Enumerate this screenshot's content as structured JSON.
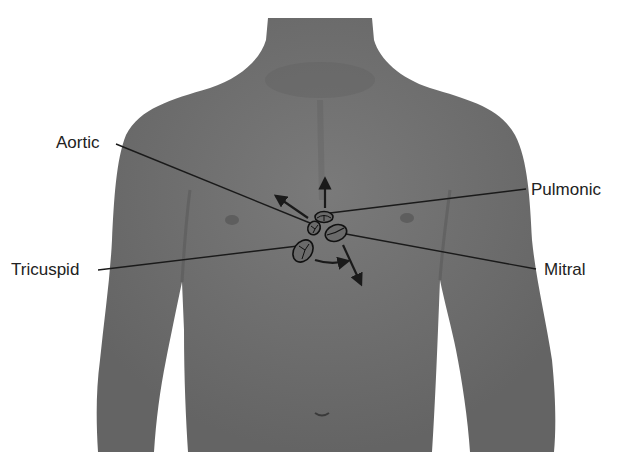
{
  "figure": {
    "colors": {
      "background": "#ffffff",
      "skin": "#6e6e6e",
      "skin_light": "#7d7d7d",
      "skin_dark": "#5a5a5a",
      "line": "#1a1a1a",
      "text": "#222222"
    }
  },
  "labels": {
    "aortic": "Aortic",
    "pulmonic": "Pulmonic",
    "tricuspid": "Tricuspid",
    "mitral": "Mitral"
  },
  "valves": [
    {
      "name": "pulmonic-valve",
      "cx": 324,
      "cy": 217
    },
    {
      "name": "aortic-valve",
      "cx": 314,
      "cy": 227
    },
    {
      "name": "mitral-valve",
      "cx": 336,
      "cy": 233
    },
    {
      "name": "tricuspid-valve",
      "cx": 303,
      "cy": 251
    }
  ],
  "arrows": [
    {
      "name": "aortic-flow-arrow",
      "from": [
        308,
        218
      ],
      "to": [
        275,
        195
      ]
    },
    {
      "name": "pulmonic-flow-arrow",
      "from": [
        325,
        208
      ],
      "to": [
        325,
        178
      ]
    },
    {
      "name": "tricuspid-flow-arrow",
      "from": [
        315,
        260
      ],
      "to": [
        350,
        262
      ]
    },
    {
      "name": "mitral-flow-arrow",
      "from": [
        343,
        245
      ],
      "to": [
        362,
        285
      ]
    }
  ],
  "leader_lines": [
    {
      "name": "aortic-leader-line",
      "from": [
        116,
        144
      ],
      "to": [
        310,
        223
      ]
    },
    {
      "name": "pulmonic-leader-line",
      "from": [
        526,
        189
      ],
      "to": [
        330,
        213
      ]
    },
    {
      "name": "tricuspid-leader-line",
      "from": [
        98,
        270
      ],
      "to": [
        298,
        246
      ]
    },
    {
      "name": "mitral-leader-line",
      "from": [
        536,
        269
      ],
      "to": [
        346,
        234
      ]
    }
  ]
}
